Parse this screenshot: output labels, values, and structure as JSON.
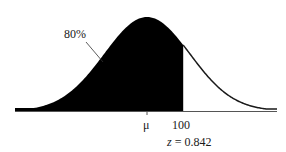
{
  "chart_data": {
    "type": "area",
    "title": "",
    "distribution": "normal",
    "shaded_region": {
      "from": "-inf",
      "to": 100,
      "area_label": "80%",
      "area": 0.8
    },
    "x_tick_labels": [
      "μ",
      "100"
    ],
    "annotations": [
      {
        "text": "80%",
        "points_to": "shaded area"
      },
      {
        "text": "z = 0.842",
        "position": "below 100 tick"
      }
    ],
    "z_value": 0.842,
    "xlabel": "",
    "ylabel": "",
    "grid": false,
    "legend": "none"
  },
  "labels": {
    "area": "80%",
    "mean": "μ",
    "value": "100",
    "z_var": "z",
    "z_eq": " = 0.842"
  },
  "colors": {
    "fill": "#000000",
    "curve": "#1a1a1a",
    "axis": "#555555"
  }
}
